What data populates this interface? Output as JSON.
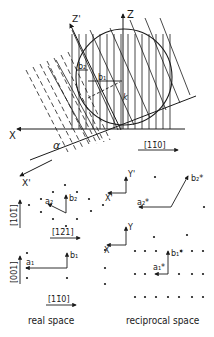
{
  "top_diagram": {
    "axes": {
      "x": "X",
      "z": "Z",
      "z_prime": "Z'",
      "x_prime": "X'"
    },
    "angle_label": "α",
    "vector_k": "k",
    "vector_b1": "b₁",
    "vector_b2": "b₂",
    "direction_label": "[11̄0]"
  },
  "real_space": {
    "upper": {
      "axis_label": "[101̄]",
      "direction_label": "[12̄1]",
      "vector_a": "a₂",
      "vector_b": "b₂"
    },
    "lower": {
      "axis_label": "[001]",
      "direction_label": "[11̄0]",
      "vector_a": "a₁",
      "vector_b": "b₁"
    },
    "caption": "real space"
  },
  "reciprocal_space": {
    "upper": {
      "axis_y": "Y'",
      "axis_x": "X'",
      "vector_a": "a₂*",
      "vector_b": "b₂*"
    },
    "lower": {
      "axis_y": "Y",
      "axis_x": "X",
      "vector_a": "a₁*",
      "vector_b": "b₁*"
    },
    "caption": "reciprocal space"
  },
  "colors": {
    "ink": "#1a1a1a",
    "background": "#ffffff"
  }
}
